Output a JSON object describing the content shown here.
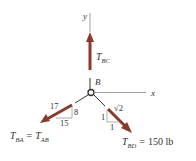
{
  "diagram": {
    "type": "free-body-diagram",
    "colors": {
      "force": "#8b3a2a",
      "line": "#555555",
      "text": "#333333"
    },
    "axes": {
      "y_label": "y",
      "x_label": "x"
    },
    "point": {
      "label": "B"
    },
    "forces": {
      "bc": {
        "symbol": "T",
        "subscript": "BC",
        "direction": "up"
      },
      "ba": {
        "symbol": "T",
        "subscript": "BA",
        "equals": "=",
        "symbol2": "T",
        "subscript2": "AB",
        "direction": "down-left",
        "slope": {
          "hypotenuse": "17",
          "vertical": "8",
          "horizontal": "15"
        }
      },
      "bd": {
        "symbol": "T",
        "subscript": "BD",
        "equals": "=",
        "value": "150 lb",
        "direction": "down-right",
        "slope": {
          "hypotenuse": "√2",
          "vertical": "1",
          "horizontal": "1"
        }
      }
    }
  }
}
